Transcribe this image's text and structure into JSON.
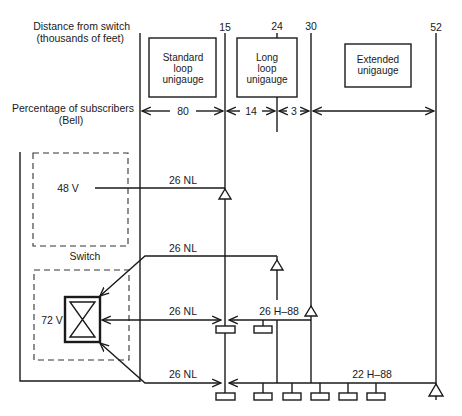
{
  "header": {
    "partial_running_header": "DESIGN OF ..."
  },
  "axis": {
    "distance_label_line1": "Distance from switch",
    "distance_label_line2": "(thousands of feet)",
    "percentage_label_line1": "Percentage of subscribers",
    "percentage_label_line2": "(Bell)",
    "distance_ticks": [
      "15",
      "24",
      "30",
      "52"
    ],
    "percentages": [
      "80",
      "14",
      "3"
    ]
  },
  "zones": [
    {
      "line1": "Standard",
      "line2": "loop",
      "line3": "unigauge"
    },
    {
      "line1": "Long",
      "line2": "loop",
      "line3": "unigauge"
    },
    {
      "line1": "Extended",
      "line2": "unigauge"
    }
  ],
  "switch": {
    "label": "Switch",
    "voltage_48": "48 V",
    "voltage_72": "72 V"
  },
  "cables": {
    "c1": "26 NL",
    "c2": "26 NL",
    "c3": "26 NL",
    "c4": "26 NL",
    "h88_26": "26 H–88",
    "h88_22": "22 H–88"
  },
  "colors": {
    "ink": "#1a1a1a",
    "background": "#ffffff"
  }
}
